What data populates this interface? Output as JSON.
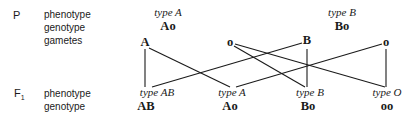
{
  "generations": {
    "parent": {
      "label": "P",
      "row_labels": [
        "phenotype",
        "genotype",
        "gametes"
      ],
      "parents": [
        {
          "phenotype": "type A",
          "genotype": "Ao",
          "gametes": [
            "A",
            "o"
          ]
        },
        {
          "phenotype": "type B",
          "genotype": "Bo",
          "gametes": [
            "B",
            "o"
          ]
        }
      ]
    },
    "f1": {
      "label": "F",
      "label_sub": "1",
      "row_labels": [
        "phenotype",
        "genotype"
      ],
      "offspring": [
        {
          "phenotype": "type AB",
          "genotype": "AB"
        },
        {
          "phenotype": "type A",
          "genotype": "Ao"
        },
        {
          "phenotype": "type B",
          "genotype": "Bo"
        },
        {
          "phenotype": "type O",
          "genotype": "oo"
        }
      ]
    }
  },
  "crosses": [
    {
      "from": "A",
      "to": "AB"
    },
    {
      "from": "A",
      "to": "Ao"
    },
    {
      "from": "o (parent 1)",
      "to": "Bo"
    },
    {
      "from": "o (parent 1)",
      "to": "oo"
    },
    {
      "from": "B",
      "to": "AB"
    },
    {
      "from": "B",
      "to": "Bo"
    },
    {
      "from": "o (parent 2)",
      "to": "Ao"
    },
    {
      "from": "o (parent 2)",
      "to": "oo"
    }
  ],
  "colors": {
    "text": "#1a1a1a",
    "lines": "#1a1a1a",
    "background": "#ffffff"
  }
}
